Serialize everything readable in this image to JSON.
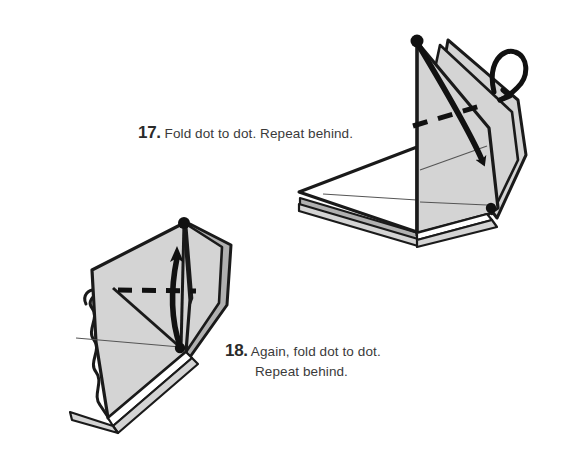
{
  "page": {
    "background_color": "#ffffff",
    "width": 574,
    "height": 473,
    "kind": "origami-instruction-diagram"
  },
  "palette": {
    "paper_front": "#d4d4d4",
    "paper_back": "#b0b0b0",
    "paper_white": "#ffffff",
    "ink": "#1a1a1a",
    "text": "#3a3a3a",
    "number": "#2b2b2b",
    "crease_thin": "#555555"
  },
  "steps": [
    {
      "number": "17.",
      "text": "Fold dot to dot. Repeat behind.",
      "lines": [
        "Fold dot to dot. Repeat behind."
      ]
    },
    {
      "number": "18.",
      "text": "Again, fold dot to dot. Repeat behind.",
      "lines": [
        "Again, fold dot to dot.",
        "Repeat behind."
      ]
    }
  ],
  "figures": [
    {
      "id": "figure-step-17",
      "position": "upper-right",
      "description": "Folded paper model standing upright with a gray vertical panel on the right, a white horizontal flap extending to the left, layered paper edges along the bottom, a black dot at the top apex and a black dot at the lower-right corner.",
      "markers": [
        {
          "name": "dot-top",
          "x": 417,
          "y": 41
        },
        {
          "name": "dot-bottom-right",
          "x": 491,
          "y": 208
        }
      ],
      "fold_line": {
        "name": "valley-fold-dashed",
        "style": "dashed",
        "orientation": "roughly horizontal, tilted up to the right"
      },
      "arrows": [
        {
          "name": "fold-arrow",
          "style": "solid curved arrow",
          "from": "dot-top",
          "to": "dot-bottom-right"
        },
        {
          "name": "repeat-behind-arrow",
          "style": "looped hook arrow",
          "position": "upper right of model"
        }
      ]
    },
    {
      "id": "figure-step-18",
      "position": "lower-left",
      "description": "The same model rotated, gray panel tilted, with an irregular wavy white flap on the left, layered paper edges along the bottom-right, a black dot at the top and a black dot at the lower middle.",
      "markers": [
        {
          "name": "dot-top",
          "x": 184,
          "y": 223
        },
        {
          "name": "dot-bottom",
          "x": 180,
          "y": 348
        }
      ],
      "fold_line": {
        "name": "valley-fold-dashed",
        "style": "dashed",
        "orientation": "horizontal"
      },
      "arrows": [
        {
          "name": "fold-arrow",
          "style": "solid curved arrow pointing up",
          "from": "dot-bottom",
          "to": "dot-top"
        }
      ]
    }
  ]
}
